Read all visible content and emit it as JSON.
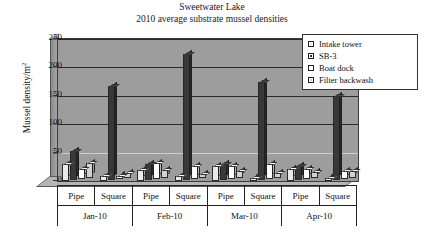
{
  "chart_data": {
    "type": "bar",
    "title": "Sweetwater Lake",
    "subtitle": "2010 average substrate mussel densities",
    "xlabel": "",
    "ylabel": "Mussel density/m2",
    "ylabel_text": "Mussel density/m",
    "ylabel_sup": "2",
    "ylim": [
      0,
      250
    ],
    "yticks": [
      250,
      200,
      150,
      100,
      50,
      0
    ],
    "grid": true,
    "legend_position": "top-right",
    "categories": [
      "Pipe",
      "Square",
      "Pipe",
      "Square",
      "Pipe",
      "Square",
      "Pipe",
      "Square"
    ],
    "group_labels": [
      "Jan-10",
      "Feb-10",
      "Mar-10",
      "Apr-10"
    ],
    "series": [
      {
        "name": "Intake tower",
        "values": [
          30,
          8,
          20,
          8,
          27,
          6,
          21,
          6
        ]
      },
      {
        "name": "SB-3",
        "values": [
          52,
          165,
          28,
          222,
          29,
          172,
          25,
          148
        ]
      },
      {
        "name": "Boat dock",
        "values": [
          18,
          5,
          29,
          24,
          24,
          27,
          18,
          15
        ]
      },
      {
        "name": "Filter backwash",
        "values": [
          27,
          10,
          15,
          7,
          13,
          9,
          12,
          13
        ]
      }
    ]
  },
  "axis": {
    "yticks": [
      {
        "label": "250",
        "value": 250
      },
      {
        "label": "200",
        "value": 200
      },
      {
        "label": "150",
        "value": 150
      },
      {
        "label": "100",
        "value": 100
      },
      {
        "label": "50",
        "value": 50
      },
      {
        "label": "0",
        "value": 0
      }
    ]
  },
  "legend": {
    "items": [
      {
        "label": "Intake tower",
        "color": "#e9e9e9",
        "marker": "square-light-icon"
      },
      {
        "label": "SB-3",
        "color": "#383838",
        "marker": "square-dark-icon"
      },
      {
        "label": "Boat dock",
        "color": "#fdfdfd",
        "marker": "square-white-icon"
      },
      {
        "label": "Filter backwash",
        "color": "#d2d2d2",
        "marker": "square-gray-icon"
      }
    ]
  },
  "colors": {
    "plot_background": "#9d9d9d",
    "frame": "#3a3a3a",
    "gridline": "#2b2b2b",
    "text": "#111111"
  }
}
